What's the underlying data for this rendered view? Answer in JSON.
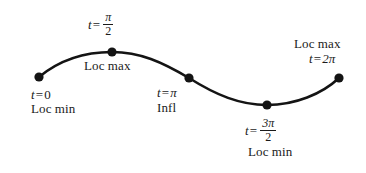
{
  "figure": {
    "width": 366,
    "height": 173,
    "background": "#ffffff",
    "curve_color": "#141414",
    "point_color": "#141414",
    "text_color": "#1a1a1a"
  },
  "labels": {
    "t0": {
      "var": "t",
      "eq": "=",
      "value": "0"
    },
    "loc_min_start": "Loc min",
    "t_pi_over_2": {
      "var": "t",
      "eq": "=",
      "num": "π",
      "den": "2"
    },
    "loc_max_peak": "Loc max",
    "t_pi": {
      "var": "t",
      "eq": "=",
      "value": "π"
    },
    "infl": "Infl",
    "t_3pi_over_2": {
      "var": "t",
      "eq": "=",
      "num": "3π",
      "den": "2"
    },
    "loc_min_trough": "Loc min",
    "loc_max_end": "Loc max",
    "t_2pi": {
      "var": "t",
      "eq": "=",
      "value": "2π"
    }
  },
  "chart_data": {
    "type": "line",
    "xlabel": "",
    "ylabel": "",
    "grid": false,
    "legend": "none",
    "xlim": [
      0,
      366
    ],
    "ylim": [
      0,
      173
    ],
    "curve_path": "M 39,77 C 62,58 88,52 112,52 C 140,52 162,62 189,78 C 216,95 240,105 267,105 C 295,105 322,94 339,78",
    "points": [
      {
        "name": "t = 0, Loc min",
        "t": "0",
        "x": 39,
        "y": 77,
        "kind": "local minimum"
      },
      {
        "name": "t = π/2, Loc max",
        "t": "π/2",
        "x": 112,
        "y": 52,
        "kind": "local maximum"
      },
      {
        "name": "t = π, Infl",
        "t": "π",
        "x": 189,
        "y": 78,
        "kind": "inflection"
      },
      {
        "name": "t = 3π/2, Loc min",
        "t": "3π/2",
        "x": 267,
        "y": 105,
        "kind": "local minimum"
      },
      {
        "name": "t = 2π, Loc max",
        "t": "2π",
        "x": 339,
        "y": 78,
        "kind": "local maximum"
      }
    ]
  }
}
